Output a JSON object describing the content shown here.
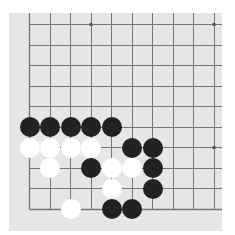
{
  "board": {
    "description": "Partial Go board fragment (lower-left corner region)",
    "columns_visible": 10,
    "rows_visible": 10,
    "grid_origin_px": [
      29,
      24
    ],
    "spacing_px": 20.5,
    "edges": {
      "left": true,
      "bottom": true,
      "top": false,
      "right": false
    },
    "star_points": [
      [
        3,
        0
      ],
      [
        9,
        0
      ],
      [
        9,
        6
      ]
    ],
    "colors": {
      "board": "#e6e6e6",
      "line": "#777777",
      "black": "#222222",
      "white": "#ffffff"
    }
  },
  "stones": [
    {
      "color": "black",
      "col": 0,
      "row": 5
    },
    {
      "color": "black",
      "col": 1,
      "row": 5
    },
    {
      "color": "black",
      "col": 2,
      "row": 5
    },
    {
      "color": "black",
      "col": 3,
      "row": 5
    },
    {
      "color": "black",
      "col": 4,
      "row": 5
    },
    {
      "color": "white",
      "col": 0,
      "row": 6
    },
    {
      "color": "white",
      "col": 1,
      "row": 6
    },
    {
      "color": "white",
      "col": 2,
      "row": 6
    },
    {
      "color": "white",
      "col": 3,
      "row": 6
    },
    {
      "color": "black",
      "col": 5,
      "row": 6
    },
    {
      "color": "black",
      "col": 6,
      "row": 6
    },
    {
      "color": "white",
      "col": 1,
      "row": 7
    },
    {
      "color": "black",
      "col": 3,
      "row": 7
    },
    {
      "color": "white",
      "col": 4,
      "row": 7
    },
    {
      "color": "white",
      "col": 5,
      "row": 7
    },
    {
      "color": "black",
      "col": 6,
      "row": 7
    },
    {
      "color": "white",
      "col": 4,
      "row": 8
    },
    {
      "color": "black",
      "col": 6,
      "row": 8
    },
    {
      "color": "white",
      "col": 2,
      "row": 9
    },
    {
      "color": "black",
      "col": 4,
      "row": 9
    },
    {
      "color": "black",
      "col": 5,
      "row": 9
    }
  ]
}
